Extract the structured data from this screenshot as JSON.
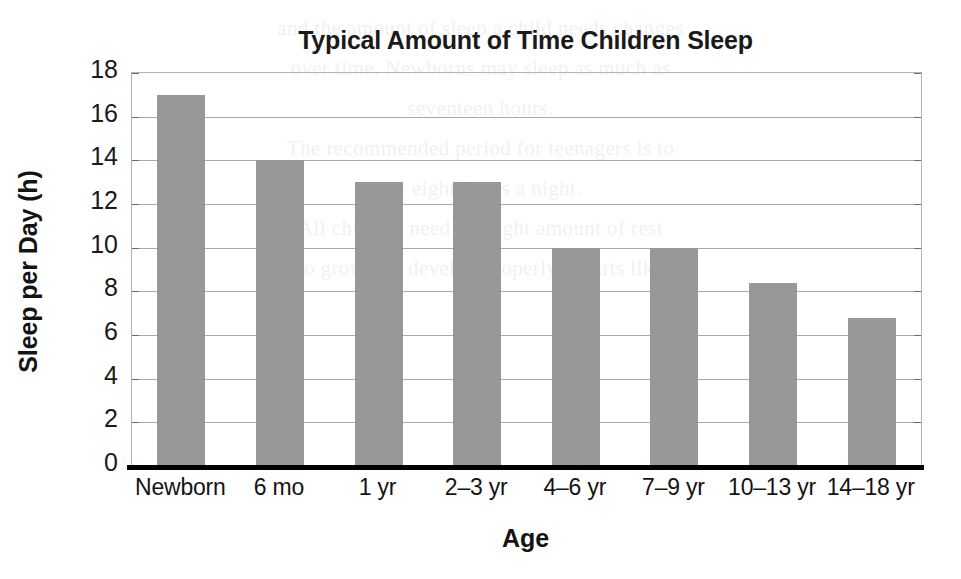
{
  "chart_data": {
    "type": "bar",
    "title": "Typical Amount of Time Children Sleep",
    "xlabel": "Age",
    "ylabel": "Sleep per Day (h)",
    "categories": [
      "Newborn",
      "6 mo",
      "1 yr",
      "2–3 yr",
      "4–6 yr",
      "7–9 yr",
      "10–13 yr",
      "14–18 yr"
    ],
    "values": [
      17,
      14,
      13,
      13,
      10,
      10,
      8.4,
      6.8
    ],
    "ylim": [
      0,
      18
    ],
    "ytick_labels": [
      "18",
      "16",
      "14",
      "12",
      "10",
      "8",
      "6",
      "4",
      "2",
      "0"
    ],
    "ytick_values": [
      18,
      16,
      14,
      12,
      10,
      8,
      6,
      4,
      2,
      0
    ],
    "grid": true,
    "legend": false,
    "bar_color": "#989898",
    "gridline_color": "#a9a9a9",
    "axis_color": "#000000",
    "text_color": "#141414"
  },
  "ghost_text": {
    "lines": [
      "",
      "",
      "",
      "",
      "and the amount of sleep a child needs changes",
      "over time. Newborns may sleep as much as",
      "seventeen hours.",
      "The recommended period for teenagers is to",
      "get eight hours a night.",
      "All children need the right amount of rest",
      "to grow and develop properly. Charts like"
    ]
  }
}
